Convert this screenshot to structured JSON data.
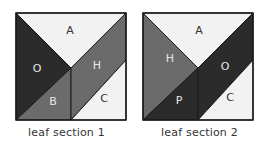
{
  "colors": {
    "light": "#f2f2f2",
    "medium": "#6b6b6b",
    "dark": "#2b2b2b",
    "outline": "#1a1a1a",
    "label_on_dark": "#e6e6e6",
    "label_on_light": "#333333"
  },
  "panels": [
    {
      "caption": "leaf section 1",
      "labels": {
        "top": "A",
        "left": "O",
        "right_mid": "H",
        "bottom_left": "B",
        "bottom_right": "C"
      }
    },
    {
      "caption": "leaf section 2",
      "labels": {
        "top": "A",
        "left": "H",
        "right_mid": "O",
        "bottom_left": "P",
        "bottom_right": "C"
      }
    }
  ]
}
